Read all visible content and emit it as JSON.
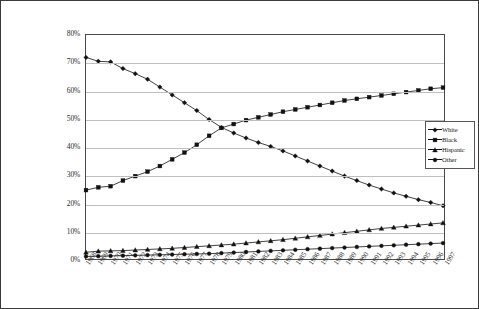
{
  "chart_data": {
    "type": "line",
    "title": "",
    "xlabel": "",
    "ylabel": "",
    "ylim": [
      0,
      80
    ],
    "ytick_labels": [
      "0%",
      "10%",
      "20%",
      "30%",
      "40%",
      "50%",
      "60%",
      "70%",
      "80%"
    ],
    "ytick_values": [
      0,
      10,
      20,
      30,
      40,
      50,
      60,
      70,
      80
    ],
    "grid": true,
    "legend_position": "right",
    "x": [
      1968,
      1969,
      1970,
      1971,
      1972,
      1973,
      1974,
      1975,
      1976,
      1977,
      1978,
      1979,
      1980,
      1981,
      1982,
      1983,
      1984,
      1985,
      1986,
      1987,
      1988,
      1989,
      1990,
      1991,
      1992,
      1993,
      1994,
      1995,
      1996,
      1997
    ],
    "categories": [
      "1968",
      "1969",
      "1970",
      "1971",
      "1972",
      "1973",
      "1974",
      "1975",
      "1976",
      "1977",
      "1978",
      "1979",
      "1980",
      "1981",
      "1982",
      "1983",
      "1984",
      "1985",
      "1986",
      "1987",
      "1988",
      "1989",
      "1990",
      "1991",
      "1992",
      "1993",
      "1994",
      "1995",
      "1996",
      "1997"
    ],
    "series": [
      {
        "name": "White",
        "marker": "diamond",
        "color": "#111111",
        "values": [
          72.0,
          70.6,
          70.4,
          68.0,
          66.2,
          64.2,
          61.4,
          58.6,
          55.8,
          53.0,
          49.8,
          47.0,
          45.0,
          43.2,
          41.6,
          40.2,
          38.6,
          36.8,
          35.0,
          33.2,
          31.4,
          29.6,
          28.0,
          26.4,
          25.0,
          23.6,
          22.4,
          21.2,
          20.2,
          19.0
        ]
      },
      {
        "name": "Black",
        "marker": "square",
        "color": "#111111",
        "values": [
          24.6,
          25.6,
          26.0,
          28.0,
          29.6,
          31.2,
          33.2,
          35.6,
          38.0,
          40.8,
          44.0,
          46.8,
          48.2,
          49.6,
          50.6,
          51.6,
          52.6,
          53.4,
          54.2,
          55.0,
          55.8,
          56.6,
          57.2,
          57.8,
          58.4,
          59.0,
          59.6,
          60.2,
          60.8,
          61.2
        ]
      },
      {
        "name": "Hispanic",
        "marker": "triangle",
        "color": "#111111",
        "values": [
          2.4,
          2.8,
          2.9,
          3.0,
          3.2,
          3.4,
          3.6,
          3.8,
          4.1,
          4.4,
          4.7,
          5.0,
          5.3,
          5.7,
          6.1,
          6.5,
          6.9,
          7.4,
          7.9,
          8.4,
          8.9,
          9.4,
          9.9,
          10.4,
          10.9,
          11.3,
          11.7,
          12.1,
          12.5,
          12.9
        ]
      },
      {
        "name": "Other",
        "marker": "circle",
        "color": "#111111",
        "values": [
          0.9,
          1.0,
          1.1,
          1.2,
          1.3,
          1.4,
          1.5,
          1.6,
          1.7,
          1.8,
          1.9,
          2.1,
          2.3,
          2.5,
          2.7,
          2.9,
          3.1,
          3.3,
          3.5,
          3.7,
          3.9,
          4.1,
          4.3,
          4.5,
          4.7,
          4.9,
          5.1,
          5.3,
          5.5,
          5.7
        ]
      }
    ]
  }
}
